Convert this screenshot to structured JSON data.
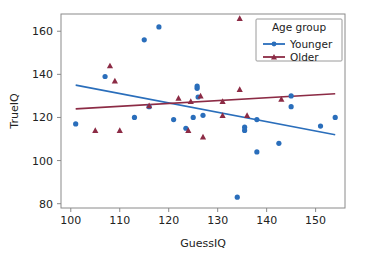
{
  "chart_data": {
    "type": "scatter",
    "title": "",
    "xlabel": "GuessIQ",
    "ylabel": "TrueIQ",
    "xlim": [
      98,
      156
    ],
    "ylim": [
      78,
      168
    ],
    "xticks": [
      100,
      110,
      120,
      130,
      140,
      150
    ],
    "yticks": [
      80,
      100,
      120,
      140,
      160
    ],
    "grid": false,
    "legend": {
      "title": "Age group",
      "position": "upper-right",
      "entries": [
        {
          "name": "Younger",
          "color": "#2a6ebb",
          "marker": "circle"
        },
        {
          "name": "Older",
          "color": "#8c2b45",
          "marker": "triangle"
        }
      ]
    },
    "series": [
      {
        "name": "Younger",
        "color": "#2a6ebb",
        "marker": "circle",
        "points": [
          [
            101.0,
            117.0
          ],
          [
            107.0,
            139.0
          ],
          [
            113.0,
            120.0
          ],
          [
            115.0,
            156.0
          ],
          [
            116.0,
            125.0
          ],
          [
            118.0,
            162.0
          ],
          [
            121.0,
            119.0
          ],
          [
            123.5,
            115.0
          ],
          [
            125.0,
            120.0
          ],
          [
            125.8,
            133.5
          ],
          [
            125.8,
            134.5
          ],
          [
            126.0,
            129.5
          ],
          [
            127.0,
            121.0
          ],
          [
            134.0,
            83.0
          ],
          [
            135.5,
            115.5
          ],
          [
            135.5,
            114.0
          ],
          [
            138.0,
            119.0
          ],
          [
            138.0,
            104.0
          ],
          [
            142.5,
            108.0
          ],
          [
            145.0,
            130.0
          ],
          [
            145.0,
            125.0
          ],
          [
            151.0,
            116.0
          ],
          [
            154.0,
            120.0
          ]
        ]
      },
      {
        "name": "Older",
        "color": "#8c2b45",
        "marker": "triangle",
        "points": [
          [
            105.0,
            114.0
          ],
          [
            108.0,
            144.0
          ],
          [
            109.0,
            137.0
          ],
          [
            110.0,
            114.0
          ],
          [
            116.0,
            125.5
          ],
          [
            122.0,
            129.0
          ],
          [
            124.0,
            114.0
          ],
          [
            124.5,
            127.5
          ],
          [
            126.5,
            130.0
          ],
          [
            127.0,
            111.0
          ],
          [
            131.0,
            121.0
          ],
          [
            131.0,
            127.5
          ],
          [
            134.5,
            166.0
          ],
          [
            134.5,
            133.0
          ],
          [
            136.0,
            121.0
          ],
          [
            143.0,
            128.5
          ]
        ]
      }
    ],
    "fit_lines": [
      {
        "name": "Younger",
        "color": "#2a6ebb",
        "x": [
          101.0,
          154.0
        ],
        "y": [
          135.0,
          112.0
        ]
      },
      {
        "name": "Older",
        "color": "#8c2b45",
        "x": [
          101.0,
          154.0
        ],
        "y": [
          124.0,
          131.0
        ]
      }
    ]
  }
}
